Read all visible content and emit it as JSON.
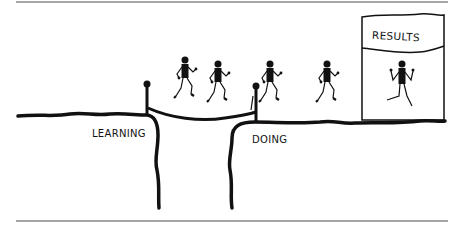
{
  "diagram": {
    "labels": {
      "left_ground": "LEARNING",
      "right_ground": "DOING",
      "banner": "RESULTS"
    },
    "figures": {
      "count_crossing": 5,
      "count_in_results": 1
    },
    "colors": {
      "ink": "#111111",
      "rule": "#888888",
      "background": "#ffffff"
    }
  }
}
